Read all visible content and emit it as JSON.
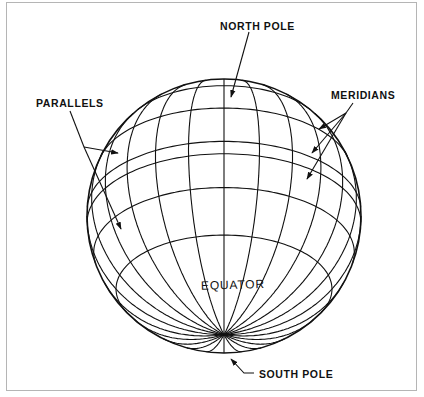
{
  "figure": {
    "labels": {
      "north_pole": "NORTH POLE",
      "south_pole": "SOUTH POLE",
      "parallels": "PARALLELS",
      "meridians": "MERIDIANS",
      "equator": "EQUATOR"
    },
    "colors": {
      "ink": "#111111",
      "frame": "#b5b5b5",
      "background": "#ffffff"
    },
    "globe": {
      "center": [
        224,
        216
      ],
      "radius": 137,
      "view_tilt_deg": 30,
      "meridian_step_deg": 15,
      "parallel_latitudes_deg": [
        80,
        62,
        42,
        22,
        3,
        -3,
        -18,
        -38
      ]
    }
  }
}
